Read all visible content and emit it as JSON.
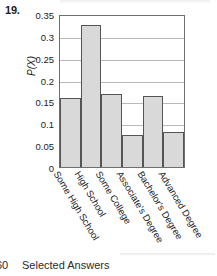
{
  "exercise": {
    "number": "19."
  },
  "footer": {
    "page": "60",
    "text": "Selected Answers"
  },
  "chart_data": {
    "type": "bar",
    "title": "",
    "xlabel": "",
    "ylabel": "P(X)",
    "categories": [
      "Some High School",
      "High School",
      "Some College",
      "Associate's Degree",
      "Bachelor's Degree",
      "Advanced Degree"
    ],
    "values": [
      0.16,
      0.33,
      0.17,
      0.075,
      0.165,
      0.082
    ],
    "ylim": [
      0,
      0.35
    ],
    "yticks": [
      0,
      0.05,
      0.1,
      0.15,
      0.2,
      0.25,
      0.3,
      0.35
    ],
    "ytick_labels": [
      "0",
      "0.05",
      "0.1",
      "0.15",
      "0.2",
      "0.25",
      "0.3",
      "0.35"
    ],
    "grid": true,
    "legend": false,
    "bar_color": "#d9d9d9",
    "bar_edge_color": "#555555",
    "grid_color": "#b9b9b9",
    "axis_color": "#6e6e6e"
  }
}
